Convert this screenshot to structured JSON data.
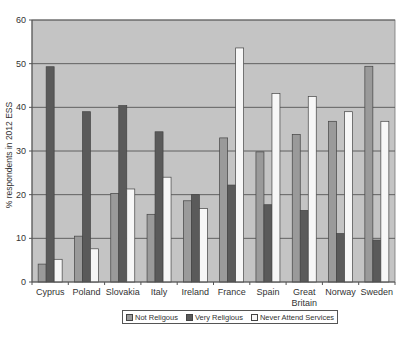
{
  "chart_data": {
    "type": "bar",
    "title": "",
    "xlabel": "",
    "ylabel": "% respondents in 2012 ESS",
    "ylim": [
      0,
      60
    ],
    "yticks": [
      0,
      10,
      20,
      30,
      40,
      50,
      60
    ],
    "grid": true,
    "legend_position": "bottom",
    "categories": [
      "Cyprus",
      "Poland",
      "Slovakia",
      "Italy",
      "Ireland",
      "France",
      "Spain",
      "Great Britain",
      "Norway",
      "Sweden"
    ],
    "category_label_lines": [
      [
        "Cyprus"
      ],
      [
        "Poland"
      ],
      [
        "Slovakia"
      ],
      [
        "Italy"
      ],
      [
        "Ireland"
      ],
      [
        "France"
      ],
      [
        "Spain"
      ],
      [
        "Great",
        "Britain"
      ],
      [
        "Norway"
      ],
      [
        "Sweden"
      ]
    ],
    "series": [
      {
        "name": "Not Religous",
        "color": "#9a9a9a",
        "values": [
          4.1,
          10.5,
          20.3,
          15.5,
          18.6,
          33.0,
          29.8,
          33.8,
          36.8,
          49.4
        ]
      },
      {
        "name": "Very Religious",
        "color": "#5a5a5a",
        "values": [
          49.3,
          39.0,
          40.4,
          34.4,
          20.0,
          22.2,
          17.7,
          16.4,
          11.1,
          9.6
        ]
      },
      {
        "name": "Never Attend Services",
        "color": "#f7f7f7",
        "values": [
          5.2,
          7.6,
          21.3,
          24.0,
          16.8,
          53.6,
          43.2,
          42.5,
          39.0,
          36.8
        ]
      }
    ]
  },
  "colors": {
    "plot_background": "#c4c4c4",
    "gridline": "#555555",
    "axis": "#555555"
  }
}
